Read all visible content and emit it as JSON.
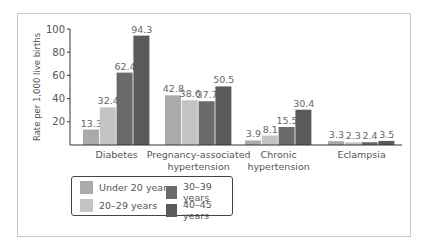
{
  "chart_data": {
    "type": "bar",
    "title": "",
    "xlabel": "",
    "ylabel": "Rate per 1,000 live births",
    "ylim": [
      0,
      100
    ],
    "yticks": [
      20,
      40,
      60,
      80,
      100
    ],
    "grid": false,
    "legend_position": "bottom-left",
    "categories": [
      "Diabetes",
      "Pregnancy-associated hypertension",
      "Chronic hypertension",
      "Eclampsia"
    ],
    "category_lines": [
      [
        "Diabetes"
      ],
      [
        "Pregnancy-associated",
        "hypertension"
      ],
      [
        "Chronic",
        "hypertension"
      ],
      [
        "Eclampsia"
      ]
    ],
    "series": [
      {
        "name": "Under 20 years",
        "color": "#aaaaaa",
        "values": [
          13.3,
          42.8,
          3.9,
          3.3
        ]
      },
      {
        "name": "20–29 years",
        "color": "#c4c4c4",
        "values": [
          32.4,
          38.6,
          8.1,
          2.3
        ]
      },
      {
        "name": "30–39 years",
        "color": "#6a6a6a",
        "values": [
          62.4,
          37.7,
          15.5,
          2.4
        ]
      },
      {
        "name": "40–45 years",
        "color": "#5a5a5a",
        "values": [
          94.3,
          50.5,
          30.4,
          3.5
        ]
      }
    ]
  },
  "legend": {
    "items": [
      {
        "label": "Under 20 years",
        "color": "#aaaaaa"
      },
      {
        "label": "20–29 years",
        "color": "#c4c4c4"
      },
      {
        "label": "30–39 years",
        "color": "#6a6a6a"
      },
      {
        "label": "40–45 years",
        "color": "#5a5a5a"
      }
    ]
  }
}
